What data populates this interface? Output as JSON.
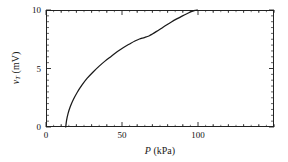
{
  "chart_data": {
    "type": "line",
    "title": "",
    "subtitle": "",
    "xlabel_main": "P",
    "xlabel_units": "(kPa)",
    "ylabel_main": "v",
    "ylabel_sub": "T",
    "ylabel_units": "(mV)",
    "xlim": [
      0,
      150
    ],
    "ylim": [
      0,
      10
    ],
    "grid": false,
    "legend": "none",
    "x_major_ticks": [
      0,
      50,
      100
    ],
    "x_major_tick_labels": [
      "0",
      "50",
      "100"
    ],
    "x_minor_tick_interval": 10,
    "y_major_ticks": [
      0,
      5,
      10
    ],
    "y_major_tick_labels": [
      "0",
      "5",
      "10"
    ],
    "y_minor_tick_interval": 0.5,
    "series": [
      {
        "name": "thermopile response",
        "color": "#1a1a1a",
        "x": [
          13.0,
          13.5,
          14.5,
          16.0,
          18.0,
          20.5,
          23.5,
          27.0,
          31.0,
          35.0,
          39.0,
          43.0,
          47.0,
          51.0,
          55.0,
          58.5,
          61.5,
          64.0,
          66.0,
          68.0,
          70.0,
          72.5,
          75.5,
          79.0,
          82.5,
          86.0,
          89.5,
          93.0,
          96.0,
          98.0,
          99.5
        ],
        "y": [
          0.0,
          0.55,
          1.15,
          1.75,
          2.35,
          2.95,
          3.55,
          4.15,
          4.7,
          5.2,
          5.65,
          6.05,
          6.45,
          6.8,
          7.1,
          7.35,
          7.52,
          7.62,
          7.7,
          7.8,
          7.95,
          8.15,
          8.4,
          8.7,
          8.98,
          9.24,
          9.48,
          9.7,
          9.88,
          9.97,
          10.0
        ]
      }
    ]
  },
  "axis": {
    "x_title_full": "P (kPa)",
    "y_title_full": "vT (mV)"
  }
}
